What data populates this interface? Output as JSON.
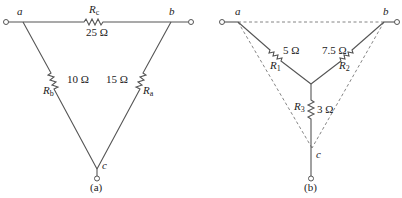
{
  "figure_a": {
    "caption": "(a)",
    "type": "delta",
    "nodes": {
      "a": "a",
      "b": "b",
      "c": "c"
    },
    "resistors": [
      {
        "name_base": "R",
        "name_sub": "c",
        "value": "25 Ω",
        "between": "a-b"
      },
      {
        "name_base": "R",
        "name_sub": "b",
        "value": "10 Ω",
        "between": "a-c"
      },
      {
        "name_base": "R",
        "name_sub": "a",
        "value": "15 Ω",
        "between": "b-c"
      }
    ]
  },
  "figure_b": {
    "caption": "(b)",
    "type": "wye",
    "nodes": {
      "a": "a",
      "b": "b",
      "c": "c"
    },
    "resistors": [
      {
        "name_base": "R",
        "name_sub": "1",
        "value": "5 Ω",
        "between": "a-center"
      },
      {
        "name_base": "R",
        "name_sub": "2",
        "value": "7.5 Ω",
        "between": "b-center"
      },
      {
        "name_base": "R",
        "name_sub": "3",
        "value": "3 Ω",
        "between": "center-c"
      }
    ]
  }
}
